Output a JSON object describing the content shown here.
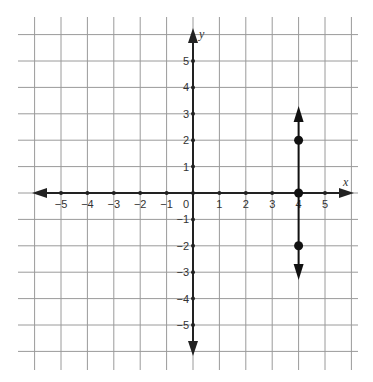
{
  "figure": {
    "type": "coordinate-plane-graph",
    "axes": {
      "x_label": "x",
      "y_label": "y",
      "x_ticks": [
        "-5",
        "-4",
        "-3",
        "-2",
        "-1",
        "0",
        "1",
        "2",
        "3",
        "4",
        "5"
      ],
      "y_ticks": [
        "5",
        "4",
        "3",
        "2",
        "1",
        "-1",
        "-2",
        "-3",
        "-4",
        "-5"
      ],
      "x_range": [
        -6,
        6
      ],
      "y_range": [
        -6,
        6
      ]
    },
    "graph": {
      "description": "Vertical line x = 4 with arrows on both ends",
      "line_x": 4,
      "points": [
        {
          "x": 4,
          "y": 2
        },
        {
          "x": 4,
          "y": 0
        },
        {
          "x": 4,
          "y": -2
        }
      ],
      "arrow_top_y": 3.3,
      "arrow_bottom_y": -3.3
    },
    "colors": {
      "grid": "#9a9a9a",
      "axis": "#222222",
      "graph": "#111111"
    }
  }
}
